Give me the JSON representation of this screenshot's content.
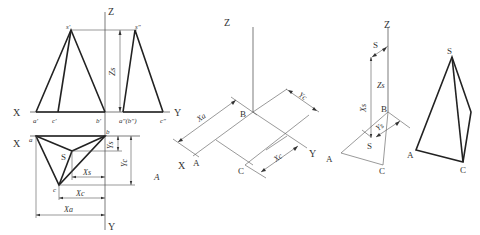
{
  "figure": {
    "panels": [
      {
        "id": "orthographic",
        "description": "Three-view projection (front, side, top) of triangular pyramid SABC"
      },
      {
        "id": "isometric-base",
        "description": "Isometric construction of base ABC using coordinates"
      },
      {
        "id": "isometric-apex",
        "description": "Locating apex S using Xs, Ys, Zs"
      },
      {
        "id": "isometric-result",
        "description": "Finished isometric pyramid SABC"
      }
    ],
    "labels": {
      "front": {
        "Z": "Z",
        "X": "X",
        "Y": "Y",
        "s1": "s′",
        "a1": "a′",
        "c1": "c′",
        "b1": "b′",
        "s2": "s″",
        "ab2": "a″(b″)",
        "c2": "c″",
        "Zs": "Zs"
      },
      "top": {
        "X": "X",
        "Y": "Y",
        "a": "a",
        "b": "b",
        "c": "c",
        "S": "S",
        "Ys": "Ys",
        "Yc": "Yc",
        "Xs": "Xs",
        "Xc": "Xc",
        "Xa": "Xa",
        "A": "A"
      },
      "iso1": {
        "Z": "Z",
        "X": "X",
        "Y": "Y",
        "A": "A",
        "B": "B",
        "C": "C",
        "Xa": "Xa",
        "Yc": "Yc",
        "Xc": "Xc"
      },
      "iso2": {
        "Z": "Z",
        "S_top": "S",
        "Zs": "Zs",
        "Xs": "Xs",
        "Ys": "Ys",
        "B": "B",
        "S": "S",
        "A": "A",
        "C": "C"
      },
      "iso3": {
        "S": "S",
        "A": "A",
        "C": "C"
      }
    },
    "colors": {
      "line": "#222222",
      "thin": "#555555",
      "text": "#333333",
      "background": "#ffffff"
    }
  }
}
